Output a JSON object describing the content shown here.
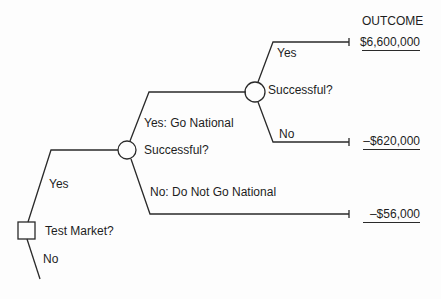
{
  "header": {
    "outcome_label": "OUTCOME"
  },
  "nodes": {
    "decision_test_market": {
      "type": "decision",
      "label": "Test Market?"
    },
    "chance_test_success": {
      "type": "chance",
      "label": "Successful?"
    },
    "chance_national_success": {
      "type": "chance",
      "label": "Successful?"
    }
  },
  "branches": {
    "test_market_yes": "Yes",
    "test_market_no": "No",
    "go_national_yes": "Yes: Go National",
    "go_national_no": "No: Do Not Go National",
    "national_success_yes": "Yes",
    "national_success_no": "No"
  },
  "outcomes": [
    {
      "path": "Test Market: Yes → Go National: Yes → Successful: Yes",
      "value": "$6,600,000"
    },
    {
      "path": "Test Market: Yes → Go National: Yes → Successful: No",
      "value": "–$620,000"
    },
    {
      "path": "Test Market: Yes → Do Not Go National",
      "value": "–$56,000"
    }
  ],
  "colors": {
    "line": "#2a2a2a",
    "text": "#1e1e1e",
    "background": "#fdfdfd"
  }
}
